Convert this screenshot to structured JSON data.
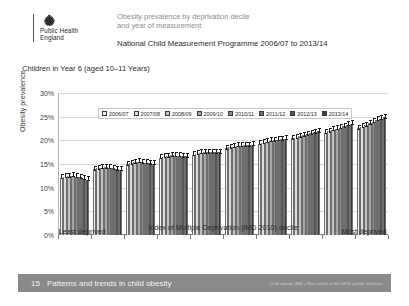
{
  "header": {
    "logo_line1": "Public Health",
    "logo_line2": "England",
    "logo_icon": "royal-crest-icon",
    "title": "Obesity prevalence by deprivation decile",
    "title_line2": "and year of measurement",
    "subtitle": "National Child Measurement Programme 2006/07 to 2013/14"
  },
  "panel_label": "Children in Year 6 (aged 10–11 Years)",
  "footer": {
    "page_number": "15",
    "text": "Patterns and trends in child obesity",
    "note": "Child obesity: BMI ≥ 95th centile of the UK90 growth reference"
  },
  "chart_data": {
    "type": "bar",
    "title": "Obesity prevalence by deprivation decile and year of measurement",
    "subtitle": "National Child Measurement Programme 2006/07 to 2013/14",
    "xlabel": "Index of Multiple Deprivation (IMD 2010) decile",
    "ylabel": "Obesity prevalence",
    "ylim": [
      0,
      30
    ],
    "ytick_labels": [
      "0%",
      "5%",
      "10%",
      "15%",
      "20%",
      "25%",
      "30%"
    ],
    "ytick_values": [
      0,
      5,
      10,
      15,
      20,
      25,
      30
    ],
    "grid": true,
    "legend_position": "top-left",
    "x_axis_left_caption": "Least deprived",
    "x_axis_right_caption": "Most deprived",
    "categories": [
      "1",
      "2",
      "3",
      "4",
      "5",
      "6",
      "7",
      "8",
      "9",
      "10"
    ],
    "series": [
      {
        "name": "2006/07",
        "color": "#f2f2f2",
        "values": [
          12.1,
          13.9,
          15.0,
          16.3,
          17.0,
          18.3,
          19.3,
          20.4,
          21.6,
          22.6
        ]
      },
      {
        "name": "2007/08",
        "color": "#dcdcdc",
        "values": [
          12.3,
          14.1,
          15.2,
          16.5,
          17.2,
          18.5,
          19.5,
          20.6,
          21.9,
          22.9
        ]
      },
      {
        "name": "2008/09",
        "color": "#c2c2c2",
        "values": [
          12.4,
          14.2,
          15.4,
          16.6,
          17.4,
          18.7,
          19.7,
          20.9,
          22.2,
          23.2
        ]
      },
      {
        "name": "2009/10",
        "color": "#a6a6a6",
        "values": [
          12.5,
          14.3,
          15.5,
          16.8,
          17.5,
          18.9,
          19.9,
          21.1,
          22.5,
          23.6
        ]
      },
      {
        "name": "2010/11",
        "color": "#8c8c8c",
        "values": [
          12.3,
          14.2,
          15.4,
          16.7,
          17.5,
          18.9,
          20.0,
          21.3,
          22.7,
          23.9
        ]
      },
      {
        "name": "2011/12",
        "color": "#6e6e6e",
        "values": [
          12.2,
          14.1,
          15.3,
          16.7,
          17.5,
          19.0,
          20.1,
          21.5,
          23.0,
          24.3
        ]
      },
      {
        "name": "2012/13",
        "color": "#555555",
        "values": [
          11.9,
          13.9,
          15.2,
          16.6,
          17.5,
          19.0,
          20.2,
          21.7,
          23.3,
          24.6
        ]
      },
      {
        "name": "2013/14",
        "color": "#3b3b3b",
        "values": [
          11.7,
          13.8,
          15.1,
          16.6,
          17.5,
          19.1,
          20.3,
          21.9,
          23.5,
          24.9
        ]
      }
    ]
  }
}
